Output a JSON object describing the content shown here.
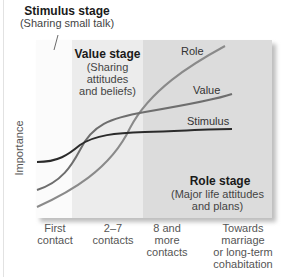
{
  "stages": {
    "stimulus": {
      "title": "Stimulus stage",
      "subtitle": "(Sharing small talk)"
    },
    "value": {
      "title": "Value stage",
      "subtitle_lines": [
        "(Sharing",
        "attitudes",
        "and beliefs)"
      ]
    },
    "role": {
      "title": "Role stage",
      "subtitle_lines": [
        "(Major life attitudes",
        "and plans)"
      ]
    }
  },
  "y_axis_label": "Importance",
  "x_axis_labels": [
    {
      "lines": [
        "First",
        "contact"
      ]
    },
    {
      "lines": [
        "2–7",
        "contacts"
      ]
    },
    {
      "lines": [
        "8 and",
        "more",
        "contacts"
      ]
    },
    {
      "lines": [
        "Towards",
        "marriage",
        "or long-term",
        "cohabitation"
      ]
    }
  ],
  "curves": [
    {
      "name": "Role",
      "color": "#8a8a8a"
    },
    {
      "name": "Value",
      "color": "#6e6e6e"
    },
    {
      "name": "Stimulus",
      "color": "#2b2b2b"
    }
  ],
  "colors": {
    "region1": "#fbfbfb",
    "region2": "#ececec",
    "region3": "#dcdcdc"
  }
}
